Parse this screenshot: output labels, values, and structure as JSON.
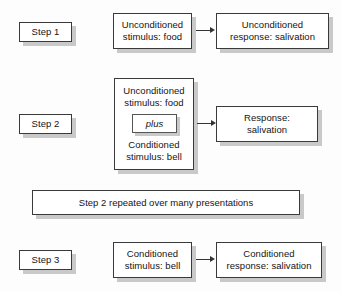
{
  "diagram": {
    "colors": {
      "background": "#fdfdfd",
      "box_fill": "#ffffff",
      "box_border": "#3a3a3a",
      "shadow": "#c9c9c9",
      "text": "#141414",
      "arrow": "#333333"
    }
  },
  "steps": [
    {
      "label": "Step 1",
      "stimulus": {
        "line1": "Unconditioned",
        "line2": "stimulus: food"
      },
      "response": {
        "line1": "Unconditioned",
        "line2": "response: salivation"
      },
      "arrow": "arrow-right"
    },
    {
      "label": "Step 2",
      "stimulus": {
        "line1": "Unconditioned",
        "line2": "stimulus: food",
        "connector": "plus",
        "line3": "Conditioned",
        "line4": "stimulus: bell"
      },
      "response": {
        "line1": "Response:",
        "line2": "salivation"
      },
      "arrow": "arrow-right"
    },
    {
      "label": "Step 3",
      "stimulus": {
        "line1": "Conditioned",
        "line2": "stimulus: bell"
      },
      "response": {
        "line1": "Conditioned",
        "line2": "response: salivation"
      },
      "arrow": "arrow-right"
    }
  ],
  "banner": {
    "text": "Step 2 repeated over many presentations"
  }
}
